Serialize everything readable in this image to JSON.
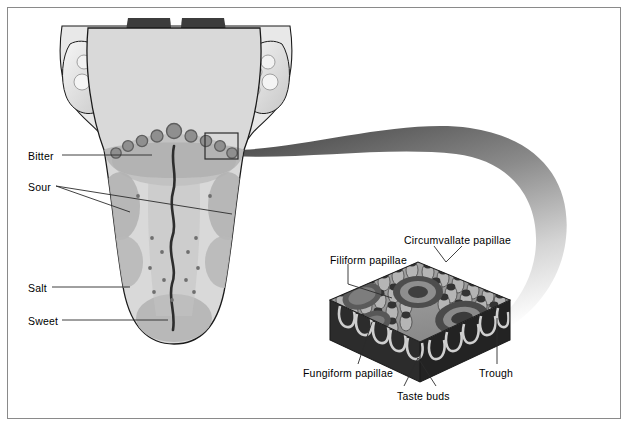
{
  "figure": {
    "frame_color": "#8a8a8a",
    "background": "#ffffff"
  },
  "taste_labels": [
    {
      "id": "bitter",
      "text": "Bitter",
      "x": 28,
      "y": 151
    },
    {
      "id": "sour",
      "text": "Sour",
      "x": 28,
      "y": 182
    },
    {
      "id": "salt",
      "text": "Salt",
      "x": 28,
      "y": 283
    },
    {
      "id": "sweet",
      "text": "Sweet",
      "x": 28,
      "y": 316
    }
  ],
  "papillae_labels": [
    {
      "id": "circumvallate",
      "text": "Circumvallate papillae",
      "x": 404,
      "y": 235
    },
    {
      "id": "filiform",
      "text": "Filiform papillae",
      "x": 330,
      "y": 255
    },
    {
      "id": "fungiform",
      "text": "Fungiform papillae",
      "x": 303,
      "y": 368
    },
    {
      "id": "trough",
      "text": "Trough",
      "x": 479,
      "y": 368
    },
    {
      "id": "taste_buds",
      "text": "Taste buds",
      "x": 397,
      "y": 391
    }
  ],
  "colors": {
    "outline": "#1a1a1a",
    "tongue_base": "#d9d9d9",
    "tongue_zone": "#b4b4b4",
    "tongue_mid": "#c6c6c6",
    "throat_dark": "#3a3a3a",
    "epiglottis": "#454545",
    "tonsil_light": "#efefef",
    "papilla_fill": "#9a9a9a",
    "papilla_rim": "#6e6e6e",
    "block_dark": "#2e2e2e",
    "block_mid": "#8d8d8d",
    "block_light": "#cfcfcf",
    "swoosh_dark": "#5f5f5f",
    "leader": "#2b2b2b"
  },
  "callout_box": {
    "x": 205,
    "y": 133,
    "w": 33,
    "h": 26
  }
}
